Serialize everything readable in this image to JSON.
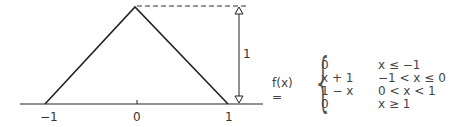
{
  "diagram": {
    "type": "triangle-function-plot",
    "x_ticks": [
      "−1",
      "0",
      "1"
    ],
    "height_label": "1",
    "function_name": "f(x) =",
    "cases": [
      {
        "expr": "0",
        "cond": "x ≤ −1"
      },
      {
        "expr": "x + 1",
        "cond": "−1 < x ≤ 0"
      },
      {
        "expr": "1 − x",
        "cond": "0 < x < 1"
      },
      {
        "expr": "0",
        "cond": "x ≥ 1"
      }
    ]
  }
}
